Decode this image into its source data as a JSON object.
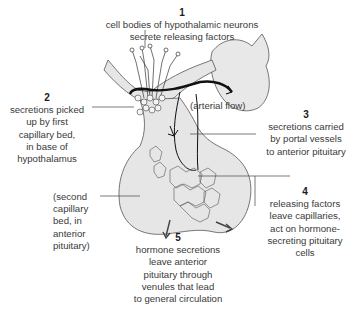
{
  "diagram": {
    "steps": [
      {
        "number": "1",
        "text": "cell bodies of hypothalamic neurons\nsecrete releasing factors"
      },
      {
        "number": "2",
        "text": "secretions picked\nup by first\ncapillary bed,\nin base of\nhypothalamus"
      },
      {
        "number": "3",
        "text": "secretions carried\nby portal vessels\nto anterior pituitary"
      },
      {
        "number": "4",
        "text": "releasing factors\nleave capillaries,\nact on hormone-\nsecreting pituitary\ncells"
      },
      {
        "number": "5",
        "text": "hormone secretions\nleave anterior\npituitary through\nvenules that lead\nto general circulation"
      }
    ],
    "annotations": {
      "arterial_flow": "(arterial flow)",
      "second_capillary_bed": "(second\ncapillary\nbed, in\nanterior\npituitary)"
    },
    "colors": {
      "tissue_fill": "#e6e6e6",
      "outline": "#555555",
      "vessel": "#1a1a1a",
      "leader_line": "#444444"
    }
  }
}
